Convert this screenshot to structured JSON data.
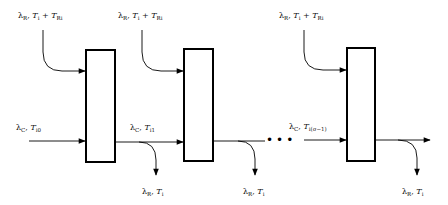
{
  "diagram": {
    "title": "",
    "stages": [
      {
        "id": "stage-1",
        "box": {
          "x": 86,
          "y": 50,
          "w": 29,
          "h": 112
        }
      },
      {
        "id": "stage-2",
        "box": {
          "x": 184,
          "y": 49,
          "w": 29,
          "h": 112
        }
      },
      {
        "id": "stage-n",
        "box": {
          "x": 347,
          "y": 48,
          "w": 28,
          "h": 113
        }
      }
    ],
    "top_inputs": [
      {
        "lambda": "λ",
        "lambda_sub": "R",
        "sep": ", ",
        "T": "T",
        "T_sub": "i",
        "plus": " + ",
        "TR": "T",
        "TR_sub": "Ri"
      },
      {
        "lambda": "λ",
        "lambda_sub": "R",
        "sep": ", ",
        "T": "T",
        "T_sub": "i",
        "plus": " + ",
        "TR": "T",
        "TR_sub": "Ri"
      },
      {
        "lambda": "λ",
        "lambda_sub": "R",
        "sep": ", ",
        "T": "T",
        "T_sub": "i",
        "plus": " + ",
        "TR": "T",
        "TR_sub": "Ri"
      }
    ],
    "chain_labels": [
      {
        "lambda": "λ",
        "lambda_sub": "C",
        "sep": ", ",
        "T": "T",
        "T_sub": "i0"
      },
      {
        "lambda": "λ",
        "lambda_sub": "C",
        "sep": ", ",
        "T": "T",
        "T_sub": "i1"
      },
      {
        "lambda": "λ",
        "lambda_sub": "C",
        "sep": ", ",
        "T": "T",
        "T_sub": "i(σ−1)"
      }
    ],
    "bottom_outputs": [
      {
        "lambda": "λ",
        "lambda_sub": "R",
        "sep": ", ",
        "T": "T",
        "T_sub": "i"
      },
      {
        "lambda": "λ",
        "lambda_sub": "R",
        "sep": ", ",
        "T": "T",
        "T_sub": "i"
      },
      {
        "lambda": "λ",
        "lambda_sub": "R",
        "sep": ", ",
        "T": "T",
        "T_sub": "i"
      }
    ],
    "ellipsis": "•••",
    "colors": {
      "stroke": "#000000",
      "background": "#ffffff"
    }
  }
}
